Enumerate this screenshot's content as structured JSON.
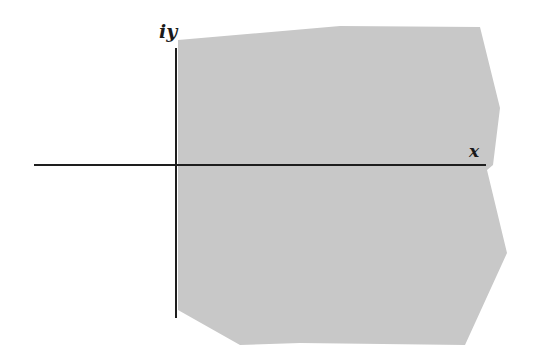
{
  "diagram": {
    "type": "complex-plane-region",
    "colors": {
      "region_fill": "#c8c8c8",
      "axis": "#1e1e1e",
      "background": "#ffffff"
    },
    "axes": {
      "x_label": "x",
      "y_label": "iy"
    },
    "region": {
      "description": "shaded region to the right of the imaginary axis (Re > 0) with irregular boundary",
      "points": "178,40 340,26 480,27 500,108 493,165 487,170 507,253 465,345 300,343 240,345 178,310"
    }
  }
}
